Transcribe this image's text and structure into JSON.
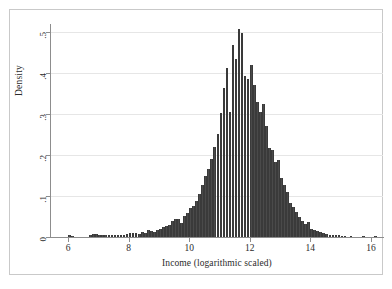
{
  "figure": {
    "background_color": "#ffffff",
    "border_color": "#c9c9c9",
    "bar_color": "#4a4a4a",
    "grid_color": "#e6e6e6",
    "axis_color": "#8d8d8d"
  },
  "chart_data": {
    "type": "bar",
    "title": "",
    "subtitle": "",
    "xlabel": "Income (logarithmic scaled)",
    "ylabel": "Density",
    "xlim": [
      5.4,
      16.4
    ],
    "ylim": [
      0,
      0.52
    ],
    "xticks": [
      6,
      8,
      10,
      12,
      14,
      16
    ],
    "xtick_labels": [
      "6",
      "8",
      "10",
      "12",
      "14",
      "16"
    ],
    "yticks": [
      0,
      0.1,
      0.2,
      0.3,
      0.4,
      0.5
    ],
    "ytick_labels": [
      "0",
      ".1",
      ".2",
      ".3",
      ".4",
      ".5"
    ],
    "grid": "horizontal",
    "legend": "none",
    "bin_width": 0.1,
    "x": [
      5.45,
      5.55,
      5.65,
      5.75,
      5.85,
      5.95,
      6.05,
      6.15,
      6.25,
      6.35,
      6.45,
      6.55,
      6.65,
      6.75,
      6.85,
      6.95,
      7.05,
      7.15,
      7.25,
      7.35,
      7.45,
      7.55,
      7.65,
      7.75,
      7.85,
      7.95,
      8.05,
      8.15,
      8.25,
      8.35,
      8.45,
      8.55,
      8.65,
      8.75,
      8.85,
      8.95,
      9.05,
      9.15,
      9.25,
      9.35,
      9.45,
      9.55,
      9.65,
      9.75,
      9.85,
      9.95,
      10.05,
      10.15,
      10.25,
      10.35,
      10.45,
      10.55,
      10.65,
      10.75,
      10.85,
      10.95,
      11.05,
      11.15,
      11.25,
      11.35,
      11.45,
      11.55,
      11.65,
      11.75,
      11.85,
      11.95,
      12.05,
      12.15,
      12.25,
      12.35,
      12.45,
      12.55,
      12.65,
      12.75,
      12.85,
      12.95,
      13.05,
      13.15,
      13.25,
      13.35,
      13.45,
      13.55,
      13.65,
      13.75,
      13.85,
      13.95,
      14.05,
      14.15,
      14.25,
      14.35,
      14.45,
      14.55,
      14.65,
      14.75,
      14.85,
      14.95,
      15.05,
      15.15,
      15.35,
      15.75,
      16.15
    ],
    "values": [
      0.0,
      0.0,
      0.0,
      0.0,
      0.0,
      0.0,
      0.004,
      0.003,
      0.0,
      0.0,
      0.0,
      0.0,
      0.0,
      0.006,
      0.008,
      0.007,
      0.006,
      0.005,
      0.004,
      0.005,
      0.005,
      0.006,
      0.006,
      0.005,
      0.006,
      0.007,
      0.009,
      0.01,
      0.01,
      0.008,
      0.013,
      0.011,
      0.017,
      0.015,
      0.012,
      0.016,
      0.019,
      0.024,
      0.026,
      0.03,
      0.038,
      0.044,
      0.045,
      0.034,
      0.051,
      0.058,
      0.072,
      0.075,
      0.089,
      0.106,
      0.126,
      0.148,
      0.166,
      0.19,
      0.22,
      0.252,
      0.302,
      0.363,
      0.412,
      0.305,
      0.468,
      0.435,
      0.508,
      0.498,
      0.392,
      0.386,
      0.42,
      0.371,
      0.33,
      0.306,
      0.325,
      0.271,
      0.218,
      0.213,
      0.182,
      0.188,
      0.145,
      0.127,
      0.11,
      0.082,
      0.073,
      0.061,
      0.049,
      0.04,
      0.031,
      0.036,
      0.02,
      0.016,
      0.014,
      0.012,
      0.01,
      0.008,
      0.006,
      0.005,
      0.004,
      0.005,
      0.003,
      0.002,
      0.002,
      0.001,
      0.001
    ]
  }
}
